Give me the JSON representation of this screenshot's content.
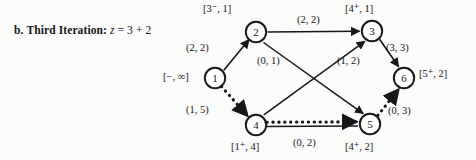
{
  "caption": {
    "enumerator": "b.",
    "title": "Third Iteration:",
    "variable": "z",
    "equals": "=",
    "expression": "3 + 2"
  },
  "diagram": {
    "type": "network-flow-graph",
    "nodes": [
      {
        "id": "1",
        "number": "1",
        "x": 215,
        "y": 78,
        "label": "[−, ∞]",
        "label_side": "left"
      },
      {
        "id": "2",
        "number": "2",
        "x": 256,
        "y": 32,
        "label": "[3⁻, 1]",
        "label_side": "top"
      },
      {
        "id": "3",
        "number": "3",
        "x": 372,
        "y": 31,
        "label": "[4⁺, 1]",
        "label_side": "top"
      },
      {
        "id": "4",
        "number": "4",
        "x": 256,
        "y": 125,
        "label": "[1⁺, 4]",
        "label_side": "bottom"
      },
      {
        "id": "5",
        "number": "5",
        "x": 370,
        "y": 124,
        "label": "[4⁺, 2]",
        "label_side": "bottom"
      },
      {
        "id": "6",
        "number": "6",
        "x": 404,
        "y": 78,
        "label": "[5⁺, 2]",
        "label_side": "right"
      }
    ],
    "edges": [
      {
        "from": "1",
        "to": "2",
        "label": "(2, 2)",
        "style": "solid",
        "lx": 186,
        "ly": 43
      },
      {
        "from": "2",
        "to": "3",
        "label": "(2, 2)",
        "style": "solid",
        "lx": 297,
        "ly": 15
      },
      {
        "from": "2",
        "to": "5",
        "label": "(0, 1)",
        "style": "solid",
        "lx": 257,
        "ly": 56
      },
      {
        "from": "4",
        "to": "3",
        "label": "(1, 2)",
        "style": "solid",
        "lx": 337,
        "ly": 56
      },
      {
        "from": "3",
        "to": "6",
        "label": "(3, 3)",
        "style": "solid",
        "lx": 386,
        "ly": 43
      },
      {
        "from": "1",
        "to": "4",
        "label": "(1, 5)",
        "style": "dotted",
        "lx": 186,
        "ly": 105
      },
      {
        "from": "4",
        "to": "5",
        "label": "(0, 2)",
        "style": "dotted",
        "lx": 293,
        "ly": 138
      },
      {
        "from": "5",
        "to": "6",
        "label": "(0, 3)",
        "style": "dotted",
        "lx": 388,
        "ly": 106
      }
    ]
  }
}
